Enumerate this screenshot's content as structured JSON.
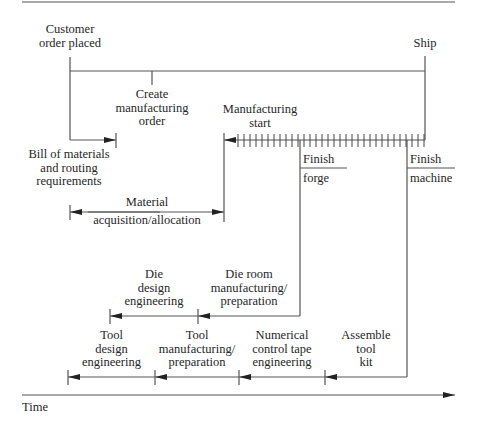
{
  "diagram": {
    "axis": {
      "label": "Time"
    },
    "milestones": {
      "customer_order": [
        "Customer",
        "order placed"
      ],
      "ship": "Ship",
      "create_order": [
        "Create",
        "manufacturing",
        "order"
      ],
      "manufacturing_start": [
        "Manufacturing",
        "start"
      ],
      "finish_forge": {
        "top": "Finish",
        "bottom": "forge"
      },
      "finish_machine": {
        "top": "Finish",
        "bottom": "machine"
      }
    },
    "activities": {
      "bill_of_materials": [
        "Bill of materials",
        "and routing",
        "requirements"
      ],
      "material": [
        "Material",
        "acquisition/allocation"
      ],
      "die_design": [
        "Die",
        "design",
        "engineering"
      ],
      "die_room": [
        "Die room",
        "manufacturing/",
        "preparation"
      ],
      "tool_design": [
        "Tool",
        "design",
        "engineering"
      ],
      "tool_manufacturing": [
        "Tool",
        "manufacturing/",
        "preparation"
      ],
      "nc_tape": [
        "Numerical",
        "control tape",
        "engineering"
      ],
      "assemble_tool_kit": [
        "Assemble",
        "tool",
        "kit"
      ]
    },
    "colors": {
      "line": "#555555",
      "text": "#262626",
      "background": "#ffffff"
    }
  }
}
